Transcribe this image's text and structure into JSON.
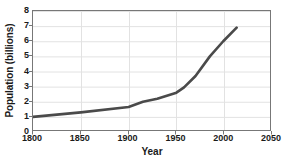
{
  "chart_data": {
    "type": "line",
    "title": "",
    "xlabel": "Year",
    "ylabel": "Population (billions)",
    "xlim": [
      1800,
      2050
    ],
    "ylim": [
      0,
      8
    ],
    "xticks": [
      1800,
      1850,
      1900,
      1950,
      2000,
      2050
    ],
    "yticks": [
      0,
      1,
      2,
      3,
      4,
      5,
      6,
      7,
      8
    ],
    "grid": true,
    "legend": "none",
    "series": [
      {
        "name": "World population",
        "x": [
          1800,
          1850,
          1900,
          1915,
          1930,
          1950,
          1958,
          1970,
          1985,
          1999,
          2013
        ],
        "values": [
          1.0,
          1.3,
          1.65,
          2.0,
          2.2,
          2.6,
          2.95,
          3.7,
          5.0,
          6.0,
          6.9
        ]
      }
    ],
    "line_color": "#4a4a4a",
    "grid_color": "#e2e2e2",
    "frame_color": "#777777"
  },
  "axes": {
    "y_tick_labels": [
      "8",
      "7",
      "6",
      "5",
      "4",
      "3",
      "2",
      "1",
      "0"
    ],
    "x_tick_labels": [
      "1800",
      "1850",
      "1900",
      "1950",
      "2000",
      "2050"
    ],
    "y_title": "Population (billions)",
    "x_title": "Year"
  }
}
